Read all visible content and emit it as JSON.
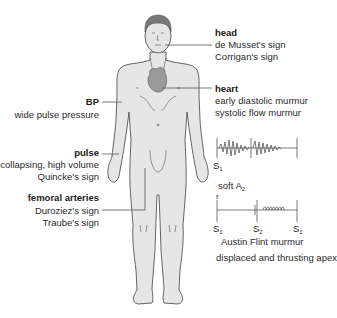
{
  "diagram": {
    "topic": "Signs of aortic regurgitation",
    "labels": {
      "head": {
        "title": "head",
        "lines": [
          "de Musset's sign",
          "Corrigan's sign"
        ]
      },
      "heart": {
        "title": "heart",
        "lines": [
          "early diastolic murmur",
          "systolic flow murmur"
        ]
      },
      "bp": {
        "title": "BP",
        "lines": [
          "wide pulse pressure"
        ]
      },
      "pulse": {
        "title": "pulse",
        "lines": [
          "collapsing, high volume",
          "Quincke's sign"
        ]
      },
      "femoral": {
        "title": "femoral arteries",
        "lines": [
          "Duroziez's sign",
          "Traube's sign"
        ]
      }
    },
    "phonocardiogram_1": {
      "marker_left": "S",
      "marker_left_sub": "1"
    },
    "soft_a2": {
      "text": "soft A",
      "sub": "2"
    },
    "phonocardiogram_2": {
      "marker_top": "r",
      "markers": [
        {
          "t": "S",
          "sub": "1"
        },
        {
          "t": "S",
          "sub": "2"
        },
        {
          "t": "S",
          "sub": "1"
        }
      ],
      "caption": "Austin Flint murmur"
    },
    "apex": "displaced and thrusting apex"
  },
  "colors": {
    "skin": "#e6e6e6",
    "outline": "#555555",
    "hair": "#777777",
    "heart": "#9a9a9a",
    "line": "#555555"
  }
}
